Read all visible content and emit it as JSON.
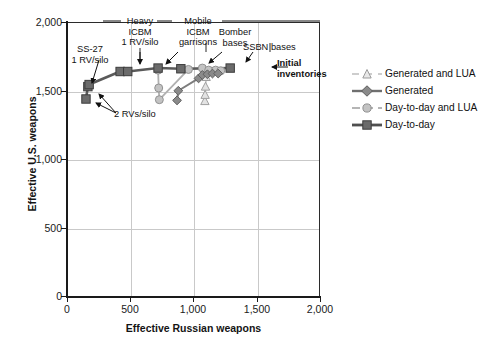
{
  "chart_data": {
    "type": "scatter",
    "title": "",
    "xlabel": "Effective Russian weapons",
    "ylabel": "Effective U.S. weapons",
    "xlim": [
      0,
      2000
    ],
    "ylim": [
      0,
      2000
    ],
    "xticks": [
      "0",
      "500",
      "1,000",
      "1,500",
      "2,000"
    ],
    "xtick_values": [
      0,
      500,
      1000,
      1500,
      2000
    ],
    "yticks": [
      "0",
      "500",
      "1,000",
      "1,500",
      "2,000"
    ],
    "ytick_values": [
      0,
      500,
      1000,
      1500,
      2000
    ],
    "grid": true,
    "legend_position": "right",
    "series": [
      {
        "name": "Day-to-day",
        "marker": "square",
        "color": "#6b6b6b",
        "line_color": "#5a5a5a",
        "points": [
          {
            "x": 150,
            "y": 1440
          },
          {
            "x": 165,
            "y": 1530
          },
          {
            "x": 175,
            "y": 1545
          },
          {
            "x": 420,
            "y": 1640
          },
          {
            "x": 480,
            "y": 1640
          },
          {
            "x": 720,
            "y": 1665
          },
          {
            "x": 900,
            "y": 1660
          },
          {
            "x": 1290,
            "y": 1665
          }
        ]
      },
      {
        "name": "Day-to-day and LUA",
        "marker": "circle",
        "color": "#b0b0b0",
        "line_color": "#a8a8a8",
        "points": [
          {
            "x": 720,
            "y": 1650
          },
          {
            "x": 725,
            "y": 1520
          },
          {
            "x": 730,
            "y": 1435
          },
          {
            "x": 960,
            "y": 1655
          },
          {
            "x": 1070,
            "y": 1665
          },
          {
            "x": 1120,
            "y": 1650
          },
          {
            "x": 1175,
            "y": 1650
          },
          {
            "x": 1215,
            "y": 1645
          }
        ]
      },
      {
        "name": "Generated",
        "marker": "diamond",
        "color": "#8a8a8a",
        "line_color": "#808080",
        "points": [
          {
            "x": 870,
            "y": 1430
          },
          {
            "x": 880,
            "y": 1500
          },
          {
            "x": 1040,
            "y": 1590
          },
          {
            "x": 1070,
            "y": 1615
          },
          {
            "x": 1110,
            "y": 1620
          },
          {
            "x": 1150,
            "y": 1625
          },
          {
            "x": 1195,
            "y": 1625
          }
        ]
      },
      {
        "name": "Generated and LUA",
        "marker": "triangle",
        "color": "#bdbdbd",
        "line_color": "#bdbdbd",
        "points": [
          {
            "x": 1090,
            "y": 1425
          },
          {
            "x": 1092,
            "y": 1470
          },
          {
            "x": 1095,
            "y": 1530
          },
          {
            "x": 1100,
            "y": 1600
          }
        ]
      }
    ],
    "annotations": [
      {
        "id": "ss27",
        "text": "SS-27\n1 RV/silo"
      },
      {
        "id": "heavy-icbm",
        "text": "Heavy\nICBM\n1 RV/silo"
      },
      {
        "id": "mobile-icbm",
        "text": "Mobile\nICBM\ngarrisons"
      },
      {
        "id": "bomber-bases",
        "text": "Bomber\nbases"
      },
      {
        "id": "ssbn-bases",
        "text": "SSBN bases"
      },
      {
        "id": "initial-inventories",
        "text": "Initial\ninventories"
      },
      {
        "id": "two-rvs",
        "text": "2 RVs/silo"
      }
    ]
  },
  "axes": {
    "x": {
      "title": "Effective Russian weapons",
      "tick_labels": [
        "0",
        "500",
        "1,000",
        "1,500",
        "2,000"
      ]
    },
    "y": {
      "title": "Effective U.S. weapons",
      "tick_labels": [
        "0",
        "500",
        "1,000",
        "1,500",
        "2,000"
      ]
    }
  },
  "legend": {
    "items": [
      {
        "label": "Generated and LUA",
        "marker": "triangle",
        "color": "#bdbdbd"
      },
      {
        "label": "Generated",
        "marker": "diamond",
        "color": "#8a8a8a"
      },
      {
        "label": "Day-to-day and LUA",
        "marker": "circle",
        "color": "#b0b0b0"
      },
      {
        "label": "Day-to-day",
        "marker": "square",
        "color": "#6b6b6b"
      }
    ]
  },
  "annotations": {
    "ss27": "SS-27\n1 RV/silo",
    "heavy_icbm": "Heavy\nICBM\n1 RV/silo",
    "mobile_icbm": "Mobile\nICBM\ngarrisons",
    "bomber_bases": "Bomber\nbases",
    "ssbn_bases": "SSBN bases",
    "initial_inventories": "Initial\ninventories",
    "two_rvs_silo": "2 RVs/silo"
  },
  "colors": {
    "frame": "#2b2b2b",
    "grid": "#c9c9c9",
    "text": "#111111",
    "day_to_day": "#6b6b6b",
    "day_to_day_lua": "#b0b0b0",
    "generated": "#8a8a8a",
    "generated_lua": "#bdbdbd"
  }
}
